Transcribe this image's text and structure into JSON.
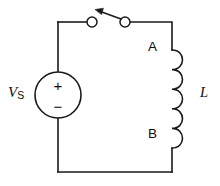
{
  "diagram": {
    "type": "electrical-circuit-schematic",
    "background_color": "#ffffff",
    "line_color": "#1a1a1a"
  },
  "source": {
    "label": "V",
    "subscript": "S",
    "symbol": "dc-voltage-source",
    "polarity_top": "+",
    "polarity_bottom": "−"
  },
  "switch": {
    "name": "switch",
    "state": "open",
    "terminal_left_label": "",
    "terminal_right_label": ""
  },
  "inductor": {
    "label": "L",
    "symbol": "inductor-coil",
    "turns": 5,
    "terminal_top_label": "A",
    "terminal_bottom_label": "B"
  }
}
